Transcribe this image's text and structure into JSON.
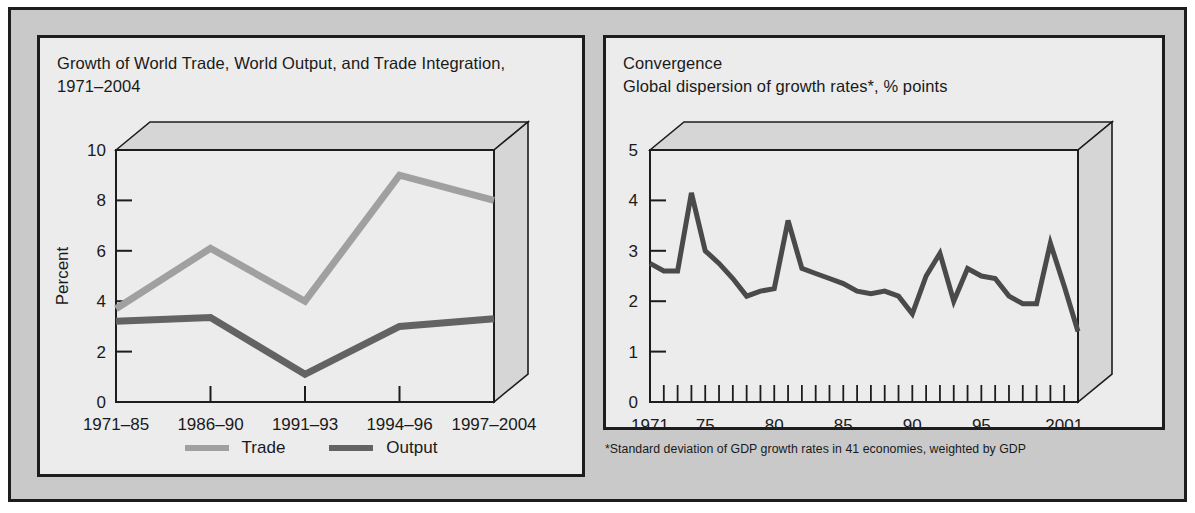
{
  "figure": {
    "background_color": "#c9c9c9",
    "panel_color": "#ececec",
    "border_color": "#1d1d1d"
  },
  "left_panel": {
    "title": "Growth of World Trade, World Output, and Trade Integration,\n1971–2004",
    "legend": [
      {
        "label": "Trade",
        "color": "#a0a0a0"
      },
      {
        "label": "Output",
        "color": "#636363"
      }
    ]
  },
  "right_panel": {
    "title": "Convergence\nGlobal dispersion of growth rates*, % points",
    "footnote": "*Standard deviation of GDP growth rates in 41 economies, weighted by GDP"
  },
  "chart_data": [
    {
      "type": "line",
      "title": "Growth of World Trade, World Output, and Trade Integration, 1971–2004",
      "xlabel": "",
      "ylabel": "Percent",
      "ylim": [
        0,
        10
      ],
      "yticks": [
        0,
        2,
        4,
        6,
        8,
        10
      ],
      "categories": [
        "1971–85",
        "1986–90",
        "1991–93",
        "1994–96",
        "1997–2004"
      ],
      "grid": false,
      "legend_position": "bottom-center",
      "three_d_box": true,
      "series": [
        {
          "name": "Trade",
          "color": "#a0a0a0",
          "values": [
            3.7,
            6.1,
            4.0,
            9.0,
            8.0
          ]
        },
        {
          "name": "Output",
          "color": "#636363",
          "values": [
            3.2,
            3.35,
            1.1,
            3.0,
            3.3
          ]
        }
      ]
    },
    {
      "type": "line",
      "title": "Convergence — Global dispersion of growth rates*, % points",
      "xlabel": "",
      "ylabel": "",
      "ylim": [
        0,
        5
      ],
      "yticks": [
        0,
        1,
        2,
        3,
        4,
        5
      ],
      "xticklabels": [
        "1971",
        "75",
        "80",
        "85",
        "90",
        "95",
        "2001"
      ],
      "xticklabel_years": [
        1971,
        1975,
        1980,
        1985,
        1990,
        1995,
        2001
      ],
      "xlim": [
        1971,
        2002
      ],
      "grid": false,
      "three_d_box": true,
      "series": [
        {
          "name": "Global dispersion of growth rates",
          "color": "#4a4a4a",
          "x": [
            1971,
            1972,
            1973,
            1974,
            1975,
            1976,
            1977,
            1978,
            1979,
            1980,
            1981,
            1982,
            1983,
            1984,
            1985,
            1986,
            1987,
            1988,
            1989,
            1990,
            1991,
            1992,
            1993,
            1994,
            1995,
            1996,
            1997,
            1998,
            1999,
            2000,
            2001,
            2002
          ],
          "values": [
            2.75,
            2.6,
            2.6,
            4.15,
            3.0,
            2.75,
            2.45,
            2.1,
            2.2,
            2.25,
            3.6,
            2.65,
            2.55,
            2.45,
            2.35,
            2.2,
            2.15,
            2.2,
            2.1,
            1.75,
            2.5,
            2.95,
            2.0,
            2.65,
            2.5,
            2.45,
            2.1,
            1.95,
            1.95,
            3.15,
            2.3,
            1.4
          ]
        }
      ]
    }
  ]
}
